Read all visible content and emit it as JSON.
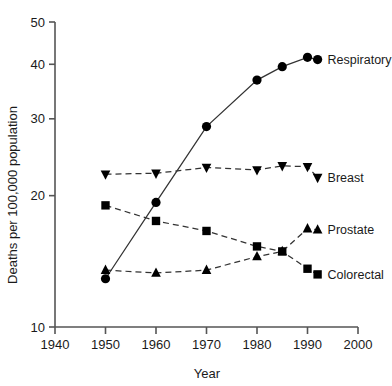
{
  "chart_data": {
    "type": "line",
    "title": "",
    "xlabel": "Year",
    "ylabel": "Deaths per 100,000 population",
    "yscale": "log",
    "xlim": [
      1940,
      2000
    ],
    "ylim": [
      10,
      50
    ],
    "grid": false,
    "legend_position": "right-inline",
    "xticks": [
      "1940",
      "1950",
      "1960",
      "1970",
      "1980",
      "1990",
      "2000"
    ],
    "xtick_values": [
      1940,
      1950,
      1960,
      1970,
      1980,
      1990,
      2000
    ],
    "yticks": [
      "10",
      "20",
      "30",
      "40",
      "50"
    ],
    "ytick_values": [
      10,
      20,
      30,
      40,
      50
    ],
    "series": [
      {
        "name": "Respiratory",
        "marker": "circle",
        "line_style": "solid",
        "x": [
          1950,
          1960,
          1970,
          1980,
          1985,
          1990,
          1992
        ],
        "values": [
          12.9,
          19.3,
          28.8,
          36.8,
          39.5,
          41.5,
          41.0
        ]
      },
      {
        "name": "Breast",
        "marker": "triangle-down",
        "line_style": "dashed",
        "x": [
          1950,
          1960,
          1970,
          1980,
          1985,
          1990,
          1992
        ],
        "values": [
          22.4,
          22.5,
          23.2,
          22.9,
          23.4,
          23.3,
          22.0
        ]
      },
      {
        "name": "Prostate",
        "marker": "triangle-up",
        "line_style": "dashed",
        "x": [
          1950,
          1960,
          1970,
          1980,
          1985,
          1990,
          1992
        ],
        "values": [
          13.5,
          13.3,
          13.5,
          14.5,
          14.9,
          16.8,
          16.7
        ]
      },
      {
        "name": "Colorectal",
        "marker": "square",
        "line_style": "dashed",
        "x": [
          1950,
          1960,
          1970,
          1980,
          1985,
          1990,
          1992
        ],
        "values": [
          19.0,
          17.5,
          16.6,
          15.3,
          14.9,
          13.6,
          13.2
        ]
      }
    ],
    "series_labels": [
      "Respiratory",
      "Breast",
      "Prostate",
      "Colorectal"
    ],
    "colors": {
      "marker": "#000000",
      "line": "#333333",
      "axis": "#555555",
      "text": "#1a1a1a",
      "background": "#ffffff"
    }
  }
}
